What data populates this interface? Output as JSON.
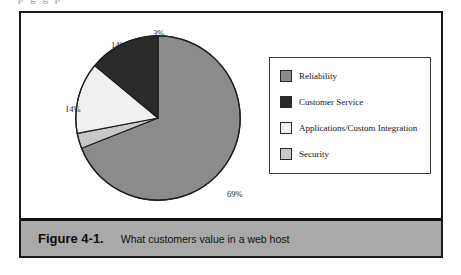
{
  "page": {
    "bleed_text": "p g     g  p"
  },
  "figure": {
    "caption_number": "Figure 4-1.",
    "caption_text": "What customers value in a web host"
  },
  "legend": {
    "items": [
      {
        "label": "Reliability",
        "color": "#8b8b8b"
      },
      {
        "label": "Customer Service",
        "color": "#2a2a2a"
      },
      {
        "label": "Applications/Custom Integration",
        "color": "#f0f0f0"
      },
      {
        "label": "Security",
        "color": "#c8c8c8"
      }
    ]
  },
  "labels": {
    "reliability": "69%",
    "customer_service": "14%",
    "applications": "14%",
    "security": "3%"
  },
  "chart_data": {
    "type": "pie",
    "title": "What customers value in a web host",
    "categories": [
      "Reliability",
      "Customer Service",
      "Applications/Custom Integration",
      "Security"
    ],
    "values": [
      69,
      14,
      14,
      3
    ],
    "value_labels": [
      "69%",
      "14%",
      "14%",
      "3%"
    ],
    "colors": [
      "#8b8b8b",
      "#2a2a2a",
      "#f0f0f0",
      "#c8c8c8"
    ],
    "start_angle_deg": 0,
    "direction": "clockwise",
    "slice_order_clockwise": [
      "Reliability",
      "Security",
      "Applications/Custom Integration",
      "Customer Service"
    ],
    "legend": true,
    "legend_position": "right",
    "grid": false,
    "xlabel": "",
    "ylabel": ""
  }
}
